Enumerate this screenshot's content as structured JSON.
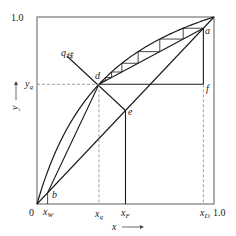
{
  "diagram": {
    "type": "McCabe-Thiele x-y diagram",
    "axis": {
      "x_label": "x",
      "y_label": "y",
      "origin_label": "0",
      "x_max_label": "1.0",
      "y_max_label": "1.0"
    },
    "alpha": 3.3,
    "points": {
      "xW": 0.06,
      "xq": 0.35,
      "yq": 0.64,
      "xF": 0.5,
      "xD": 0.94
    },
    "labels": {
      "a": "a",
      "b": "b",
      "d": "d",
      "e": "e",
      "f": "f",
      "q_line": "q",
      "q_line_sub": "线",
      "xW": "x",
      "xW_sub": "W",
      "xq": "x",
      "xq_sub": "q",
      "xF": "x",
      "xF_sub": "F",
      "xD": "x",
      "xD_sub": "D",
      "yq": "y",
      "yq_sub": "q"
    },
    "q_line_start": [
      0.17,
      0.79
    ]
  }
}
